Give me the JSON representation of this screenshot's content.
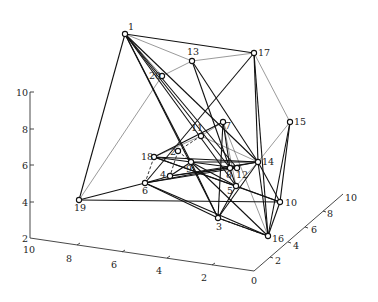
{
  "diagram": {
    "type": "3d-network-graph",
    "nodes": [
      {
        "id": "1",
        "x": 125,
        "y": 34,
        "lx": 128,
        "ly": 30
      },
      {
        "id": "13",
        "x": 192,
        "y": 61,
        "lx": 187,
        "ly": 55
      },
      {
        "id": "17",
        "x": 254,
        "y": 53,
        "lx": 258,
        "ly": 56
      },
      {
        "id": "20",
        "x": 162,
        "y": 76,
        "lx": 149,
        "ly": 79
      },
      {
        "id": "15",
        "x": 290,
        "y": 122,
        "lx": 294,
        "ly": 125
      },
      {
        "id": "7",
        "x": 223,
        "y": 122,
        "lx": 225,
        "ly": 129
      },
      {
        "id": "11",
        "x": 201,
        "y": 136,
        "lx": 191,
        "ly": 131
      },
      {
        "id": "2",
        "x": 178,
        "y": 151,
        "lx": 170,
        "ly": 155
      },
      {
        "id": "18",
        "x": 154,
        "y": 157,
        "lx": 141,
        "ly": 160
      },
      {
        "id": "9",
        "x": 191,
        "y": 162,
        "lx": 186,
        "ly": 172
      },
      {
        "id": "14",
        "x": 258,
        "y": 162,
        "lx": 262,
        "ly": 165
      },
      {
        "id": "8",
        "x": 230,
        "y": 168,
        "lx": 226,
        "ly": 178
      },
      {
        "id": "12",
        "x": 237,
        "y": 168,
        "lx": 236,
        "ly": 178
      },
      {
        "id": "4",
        "x": 170,
        "y": 176,
        "lx": 160,
        "ly": 178
      },
      {
        "id": "6",
        "x": 145,
        "y": 183,
        "lx": 142,
        "ly": 194
      },
      {
        "id": "5",
        "x": 236,
        "y": 186,
        "lx": 227,
        "ly": 194
      },
      {
        "id": "10",
        "x": 280,
        "y": 202,
        "lx": 285,
        "ly": 206
      },
      {
        "id": "19",
        "x": 79,
        "y": 200,
        "lx": 74,
        "ly": 211
      },
      {
        "id": "3",
        "x": 218,
        "y": 218,
        "lx": 216,
        "ly": 230
      },
      {
        "id": "16",
        "x": 268,
        "y": 236,
        "lx": 272,
        "ly": 242
      }
    ],
    "edges_solid": [
      [
        "1",
        "17"
      ],
      [
        "1",
        "19"
      ],
      [
        "1",
        "9"
      ],
      [
        "1",
        "8"
      ],
      [
        "1",
        "14"
      ],
      [
        "1",
        "3"
      ],
      [
        "1",
        "5"
      ],
      [
        "1",
        "12"
      ],
      [
        "17",
        "6"
      ],
      [
        "17",
        "14"
      ],
      [
        "17",
        "16"
      ],
      [
        "13",
        "14"
      ],
      [
        "13",
        "5"
      ],
      [
        "15",
        "10"
      ],
      [
        "15",
        "16"
      ],
      [
        "7",
        "18"
      ],
      [
        "7",
        "8"
      ],
      [
        "7",
        "3"
      ],
      [
        "18",
        "14"
      ],
      [
        "18",
        "9"
      ],
      [
        "18",
        "10"
      ],
      [
        "18",
        "5"
      ],
      [
        "19",
        "6"
      ],
      [
        "19",
        "10"
      ],
      [
        "6",
        "4"
      ],
      [
        "6",
        "14"
      ],
      [
        "6",
        "12"
      ],
      [
        "6",
        "3"
      ],
      [
        "6",
        "16"
      ],
      [
        "4",
        "9"
      ],
      [
        "4",
        "8"
      ],
      [
        "4",
        "14"
      ],
      [
        "9",
        "14"
      ],
      [
        "9",
        "3"
      ],
      [
        "9",
        "12"
      ],
      [
        "9",
        "16"
      ],
      [
        "14",
        "3"
      ],
      [
        "14",
        "10"
      ],
      [
        "14",
        "16"
      ],
      [
        "5",
        "9"
      ],
      [
        "5",
        "10"
      ],
      [
        "5",
        "3"
      ],
      [
        "3",
        "16"
      ],
      [
        "10",
        "16"
      ]
    ],
    "edges_thin": [
      [
        "1",
        "13"
      ],
      [
        "1",
        "20"
      ],
      [
        "13",
        "17"
      ],
      [
        "13",
        "20"
      ],
      [
        "17",
        "15"
      ],
      [
        "20",
        "19"
      ],
      [
        "11",
        "7"
      ],
      [
        "11",
        "14"
      ],
      [
        "11",
        "18"
      ],
      [
        "15",
        "14"
      ],
      [
        "7",
        "16"
      ],
      [
        "7",
        "5"
      ],
      [
        "14",
        "5"
      ],
      [
        "3",
        "16"
      ]
    ],
    "edges_dashed": [
      [
        "18",
        "6"
      ],
      [
        "2",
        "9"
      ],
      [
        "2",
        "4"
      ],
      [
        "11",
        "2"
      ],
      [
        "3",
        "16"
      ]
    ]
  },
  "axes": {
    "z": {
      "ticks": [
        "2",
        "4",
        "6",
        "8",
        "10"
      ]
    },
    "x": {
      "ticks": [
        "10",
        "8",
        "6",
        "4",
        "2"
      ]
    },
    "y": {
      "ticks": [
        "0",
        "2",
        "4",
        "6",
        "8",
        "10"
      ]
    }
  }
}
